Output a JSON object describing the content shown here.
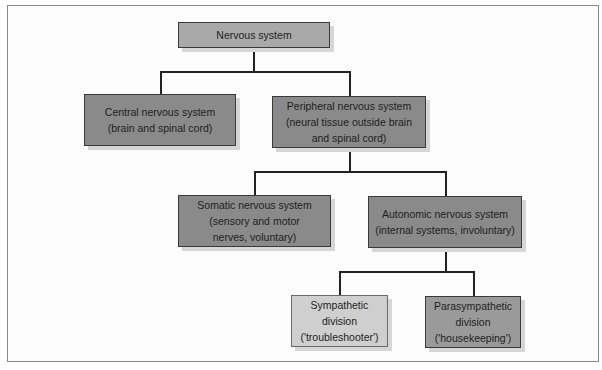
{
  "diagram": {
    "type": "hierarchy",
    "colors": {
      "level_root": "#a9a9a9",
      "level_dark": "#8a8a8a",
      "sympathetic": "#cfcfcf",
      "parasympathetic": "#9a9a9a",
      "connector": "#222222",
      "frame_border": "#8a8a8a"
    },
    "nodes": {
      "root": {
        "label": "Nervous system"
      },
      "central": {
        "label": "Central nervous system\n(brain and spinal cord)"
      },
      "peripheral": {
        "label": "Peripheral nervous system\n(neural tissue outside brain\nand spinal cord)"
      },
      "somatic": {
        "label": "Somatic nervous system\n(sensory and motor\nnerves, voluntary)"
      },
      "autonomic": {
        "label": "Autonomic nervous system\n(internal systems, involuntary)"
      },
      "sympathetic": {
        "label": "Sympathetic\ndivision\n('troubleshooter')"
      },
      "parasympathetic": {
        "label": "Parasympathetic\ndivision\n('housekeeping')"
      }
    },
    "edges": [
      [
        "root",
        "central"
      ],
      [
        "root",
        "peripheral"
      ],
      [
        "peripheral",
        "somatic"
      ],
      [
        "peripheral",
        "autonomic"
      ],
      [
        "autonomic",
        "sympathetic"
      ],
      [
        "autonomic",
        "parasympathetic"
      ]
    ]
  }
}
